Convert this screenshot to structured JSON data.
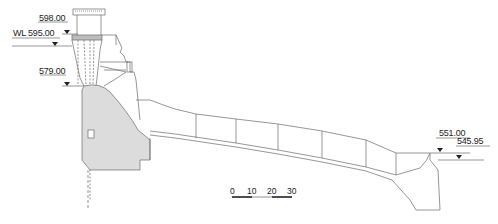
{
  "diagram": {
    "type": "spillway-dam-cross-section",
    "elevations": [
      {
        "id": "crest",
        "label": "598.00"
      },
      {
        "id": "water-level",
        "label": "WL 595.00"
      },
      {
        "id": "sill",
        "label": "579.00"
      },
      {
        "id": "downstream-high",
        "label": "551.00"
      },
      {
        "id": "downstream-tailwater",
        "label": "545.95"
      }
    ],
    "scale_bar": {
      "ticks": [
        "0",
        "10",
        "20",
        "30"
      ]
    },
    "colors": {
      "line": "#6a6a6a",
      "concrete_fill": "#dcdcdc",
      "text": "#222222"
    }
  }
}
